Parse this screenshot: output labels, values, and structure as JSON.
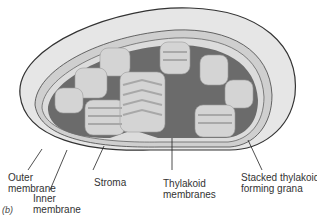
{
  "figure": {
    "panel_label": "(b)",
    "colors": {
      "outer_membrane_fill": "#e6e6e6",
      "outline": "#333333",
      "stroma": "#6b6b6b",
      "thylakoid": "#d4d4d4",
      "thylakoid_shadow": "#a8a8a8"
    }
  },
  "labels": {
    "outer_membrane": {
      "line1": "Outer",
      "line2": "membrane"
    },
    "inner_membrane": {
      "line1": "Inner",
      "line2": "membrane"
    },
    "stroma": "Stroma",
    "thylakoid_membranes": {
      "line1": "Thylakoid",
      "line2": "membranes"
    },
    "grana": {
      "line1": "Stacked thylakoids",
      "line2": "forming grana"
    }
  }
}
